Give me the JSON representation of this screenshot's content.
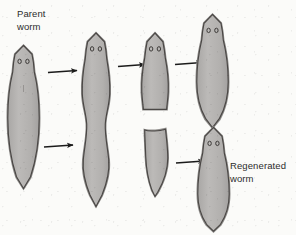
{
  "figure": {
    "background_color": "#fbfbf9",
    "body_fill": "#b6b4b2",
    "body_stroke": "#4a4745",
    "outline_band": "#8f8d8b",
    "arrow_color": "#1b1b1b",
    "text_color": "#2c2c2c"
  },
  "labels": {
    "parent": "Parent\nworm",
    "regenerated": "Regenerated\nworm"
  },
  "stages": [
    {
      "id": "stage-1-parent-worm",
      "name": "parent-worm",
      "description": "Intact parent planarian with arrow-shaped head and two eyespots",
      "eyes": 2,
      "column": 1,
      "row": "full"
    },
    {
      "id": "stage-2-elongated-worm",
      "name": "elongated-worm",
      "description": "Parent worm elongated and constricting at the midsection before splitting",
      "eyes": 2,
      "column": 2,
      "row": "full"
    },
    {
      "id": "stage-3-anterior-fragment",
      "name": "anterior-fragment",
      "description": "Upper head-bearing fragment with flat cut surface at its base",
      "eyes": 2,
      "column": 3,
      "row": "top"
    },
    {
      "id": "stage-3-posterior-fragment",
      "name": "posterior-fragment",
      "description": "Lower tail fragment with flat cut surface at its top and no eyespots",
      "eyes": 0,
      "column": 3,
      "row": "bottom"
    },
    {
      "id": "stage-4-regenerated-worm-top",
      "name": "regenerated-worm-top",
      "description": "Complete regenerated planarian grown from the anterior fragment",
      "eyes": 2,
      "column": 4,
      "row": "top"
    },
    {
      "id": "stage-4-regenerated-worm-bottom",
      "name": "regenerated-worm-bottom",
      "description": "Complete regenerated planarian grown from the posterior fragment",
      "eyes": 2,
      "column": 4,
      "row": "bottom"
    }
  ],
  "arrows": [
    {
      "id": "arrow-1",
      "name": "arrow-parent-to-elongated",
      "from": "stage-1-parent-worm",
      "to": "stage-2-elongated-worm",
      "direction": "right"
    },
    {
      "id": "arrow-2",
      "name": "arrow-elongated-to-anterior-fragment",
      "from": "stage-2-elongated-worm",
      "to": "stage-3-anterior-fragment",
      "direction": "right"
    },
    {
      "id": "arrow-3",
      "name": "arrow-elongated-to-posterior-fragment",
      "from": "stage-2-elongated-worm",
      "to": "stage-3-posterior-fragment",
      "direction": "right"
    },
    {
      "id": "arrow-4",
      "name": "arrow-anterior-fragment-to-regenerated",
      "from": "stage-3-anterior-fragment",
      "to": "stage-4-regenerated-worm-top",
      "direction": "right"
    },
    {
      "id": "arrow-5",
      "name": "arrow-posterior-fragment-to-regenerated",
      "from": "stage-3-posterior-fragment",
      "to": "stage-4-regenerated-worm-bottom",
      "direction": "right"
    }
  ]
}
